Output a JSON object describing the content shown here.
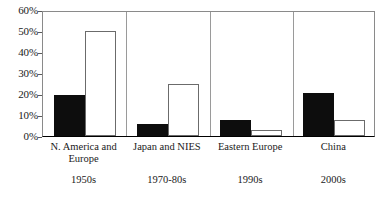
{
  "chart_data": {
    "type": "bar",
    "title": "",
    "subtitle": "",
    "xlabel": "",
    "ylabel": "",
    "ylim": [
      0,
      60
    ],
    "yticks": [
      "0%",
      "10%",
      "20%",
      "30%",
      "40%",
      "50%",
      "60%"
    ],
    "ytick_values": [
      0,
      10,
      20,
      30,
      40,
      50,
      60
    ],
    "grid": false,
    "legend": "none",
    "categories": [
      "N. America and\nEurope",
      "Japan and NIES",
      "Eastern Europe",
      "China"
    ],
    "secondary_categories": [
      "1950s",
      "1970-80s",
      "1990s",
      "2000s"
    ],
    "series": [
      {
        "name": "filled",
        "values": [
          19.5,
          5.5,
          7.5,
          20.5
        ]
      },
      {
        "name": "hollow",
        "values": [
          50.0,
          25.0,
          3.0,
          7.8
        ]
      }
    ],
    "colors": {
      "filled": "#0d0d0d",
      "hollow_fill": "#ffffff",
      "hollow_edge": "#6b6b6b",
      "axis": "#000000",
      "frame": "#8a8a8a",
      "text": "#1a1a1a",
      "background": "#ffffff"
    }
  }
}
